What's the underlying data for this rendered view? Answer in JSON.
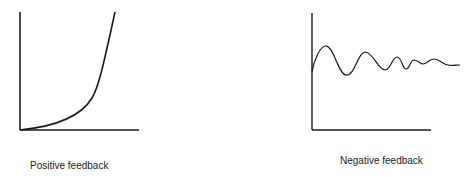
{
  "diagrams": [
    {
      "id": "positive",
      "caption": "Positive feedback",
      "description": "Exponentially rising curve"
    },
    {
      "id": "negative",
      "caption": "Negative feedback",
      "description": "Damped oscillation settling to a steady level"
    }
  ],
  "colors": {
    "line": "#1a1a1a",
    "background": "#ffffff"
  }
}
